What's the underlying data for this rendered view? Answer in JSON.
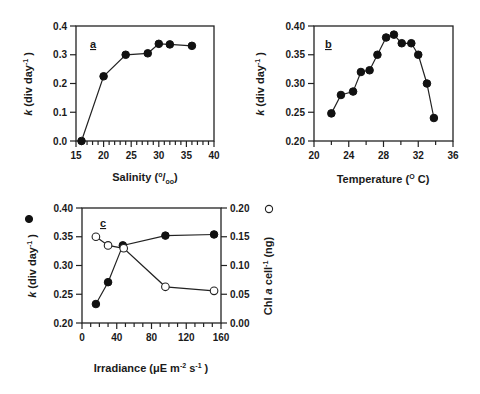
{
  "chart_data": [
    {
      "panel": "a",
      "type": "line",
      "title": "",
      "panel_label": "a",
      "xlabel": "Salinity (‰)",
      "xlabel_main": "Salinity (",
      "xlabel_sup": "o",
      "xlabel_slash": "/",
      "xlabel_sub": "oo",
      "xlabel_close": ")",
      "ylabel": "k (div day⁻¹)",
      "ylabel_k": "k",
      "ylabel_rest": " (div day",
      "ylabel_sup": "-1",
      "ylabel_close": " )",
      "xlim": [
        15,
        40
      ],
      "ylim": [
        0.0,
        0.4
      ],
      "xticks": [
        "15",
        "20",
        "25",
        "30",
        "35",
        "40"
      ],
      "yticks": [
        "0.0",
        "0.1",
        "0.2",
        "0.3",
        "0.4"
      ],
      "x_minor_step": 1,
      "grid": false,
      "series": [
        {
          "name": "k",
          "marker": "filled-circle",
          "x": [
            16,
            20,
            24,
            28,
            30,
            32,
            36
          ],
          "values": [
            0.0,
            0.225,
            0.3,
            0.305,
            0.338,
            0.336,
            0.331
          ]
        }
      ]
    },
    {
      "panel": "b",
      "type": "line",
      "title": "",
      "panel_label": "b",
      "xlabel": "Temperature (°C)",
      "xlabel_main": "Temperature (",
      "xlabel_sup": "O",
      "xlabel_close": " C)",
      "ylabel": "k (div day⁻¹)",
      "ylabel_k": "k",
      "ylabel_rest": " (div day",
      "ylabel_sup": "-1",
      "ylabel_close": " )",
      "xlim": [
        20,
        36
      ],
      "ylim": [
        0.2,
        0.4
      ],
      "xticks": [
        "20",
        "24",
        "28",
        "32",
        "36"
      ],
      "yticks": [
        "0.20",
        "0.25",
        "0.30",
        "0.35",
        "0.40"
      ],
      "x_minor_step": 2,
      "grid": false,
      "series": [
        {
          "name": "k",
          "marker": "filled-circle",
          "x": [
            22,
            23.1,
            24.5,
            25.4,
            26.4,
            27.3,
            28.3,
            29.2,
            30.1,
            31.2,
            32,
            33,
            33.8
          ],
          "values": [
            0.248,
            0.28,
            0.286,
            0.32,
            0.323,
            0.35,
            0.38,
            0.385,
            0.37,
            0.37,
            0.35,
            0.3,
            0.24
          ]
        }
      ]
    },
    {
      "panel": "c",
      "type": "line",
      "title": "",
      "panel_label": "c",
      "xlabel": "Irradiance (μE m⁻² s⁻¹)",
      "xlabel_main": "Irradiance (μE m",
      "xlabel_sup1": "-2",
      "xlabel_mid": "  s",
      "xlabel_sup2": "-1",
      "xlabel_close": " )",
      "ylabel": "k (div day⁻¹)",
      "ylabel_k": "k",
      "ylabel_rest": " (div day",
      "ylabel_sup": "-1",
      "ylabel_close": " )",
      "ylabel_right": "Chl a cell⁻¹ (ng)",
      "ylabel_right_pre": "Chl ",
      "ylabel_right_a": "a",
      "ylabel_right_mid": " cell",
      "ylabel_right_sup": "-1",
      "ylabel_right_close": " (ng)",
      "legend_left_symbol": "●",
      "legend_right_symbol": "○",
      "xlim": [
        0,
        160
      ],
      "ylim": [
        0.2,
        0.4
      ],
      "ylim_right": [
        0.0,
        0.2
      ],
      "xticks": [
        "0",
        "40",
        "80",
        "120",
        "160"
      ],
      "yticks": [
        "0.20",
        "0.25",
        "0.30",
        "0.35",
        "0.40"
      ],
      "yticks_right": [
        "0.00",
        "0.05",
        "0.10",
        "0.15",
        "0.20"
      ],
      "x_minor_step": 10,
      "grid": false,
      "series": [
        {
          "name": "k (div day-1)",
          "axis": "left",
          "marker": "filled-circle",
          "x": [
            16,
            30,
            47,
            96,
            152
          ],
          "values": [
            0.233,
            0.271,
            0.335,
            0.352,
            0.354
          ]
        },
        {
          "name": "Chl a cell-1 (ng)",
          "axis": "right",
          "marker": "open-circle",
          "x": [
            16,
            30,
            48,
            96,
            152
          ],
          "values": [
            0.15,
            0.135,
            0.13,
            0.063,
            0.056
          ]
        }
      ]
    }
  ]
}
